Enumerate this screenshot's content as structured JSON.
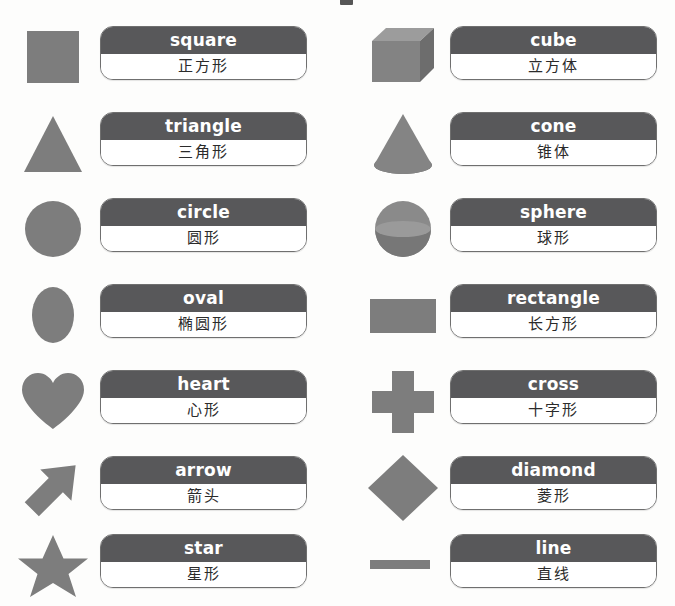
{
  "page": {
    "background_color": "#fdfdfc",
    "shape_fill": "#7d7d7d",
    "card_header_color": "#58585a",
    "card_border_color": "#6f6f6f",
    "card_text_color": "#ffffff",
    "card_zh_text_color": "#2b2b2b"
  },
  "columns": {
    "left_label": "left-column",
    "right_label": "right-column"
  },
  "entries": [
    {
      "id": "square",
      "column": "left",
      "row": 1,
      "icon": "square-shape-icon",
      "english": "square",
      "chinese": "正方形"
    },
    {
      "id": "cube",
      "column": "right",
      "row": 1,
      "icon": "cube-shape-icon",
      "english": "cube",
      "chinese": "立方体"
    },
    {
      "id": "triangle",
      "column": "left",
      "row": 2,
      "icon": "triangle-shape-icon",
      "english": "triangle",
      "chinese": "三角形"
    },
    {
      "id": "cone",
      "column": "right",
      "row": 2,
      "icon": "cone-shape-icon",
      "english": "cone",
      "chinese": "锥体"
    },
    {
      "id": "circle",
      "column": "left",
      "row": 3,
      "icon": "circle-shape-icon",
      "english": "circle",
      "chinese": "圆形"
    },
    {
      "id": "sphere",
      "column": "right",
      "row": 3,
      "icon": "sphere-shape-icon",
      "english": "sphere",
      "chinese": "球形"
    },
    {
      "id": "oval",
      "column": "left",
      "row": 4,
      "icon": "oval-shape-icon",
      "english": "oval",
      "chinese": "椭圆形"
    },
    {
      "id": "rectangle",
      "column": "right",
      "row": 4,
      "icon": "rectangle-shape-icon",
      "english": "rectangle",
      "chinese": "长方形"
    },
    {
      "id": "heart",
      "column": "left",
      "row": 5,
      "icon": "heart-shape-icon",
      "english": "heart",
      "chinese": "心形"
    },
    {
      "id": "cross",
      "column": "right",
      "row": 5,
      "icon": "cross-shape-icon",
      "english": "cross",
      "chinese": "十字形"
    },
    {
      "id": "arrow",
      "column": "left",
      "row": 6,
      "icon": "arrow-shape-icon",
      "english": "arrow",
      "chinese": "箭头"
    },
    {
      "id": "diamond",
      "column": "right",
      "row": 6,
      "icon": "diamond-shape-icon",
      "english": "diamond",
      "chinese": "菱形"
    },
    {
      "id": "star",
      "column": "left",
      "row": 7,
      "icon": "star-shape-icon",
      "english": "star",
      "chinese": "星形"
    },
    {
      "id": "line",
      "column": "right",
      "row": 7,
      "icon": "line-shape-icon",
      "english": "line",
      "chinese": "直线"
    }
  ]
}
